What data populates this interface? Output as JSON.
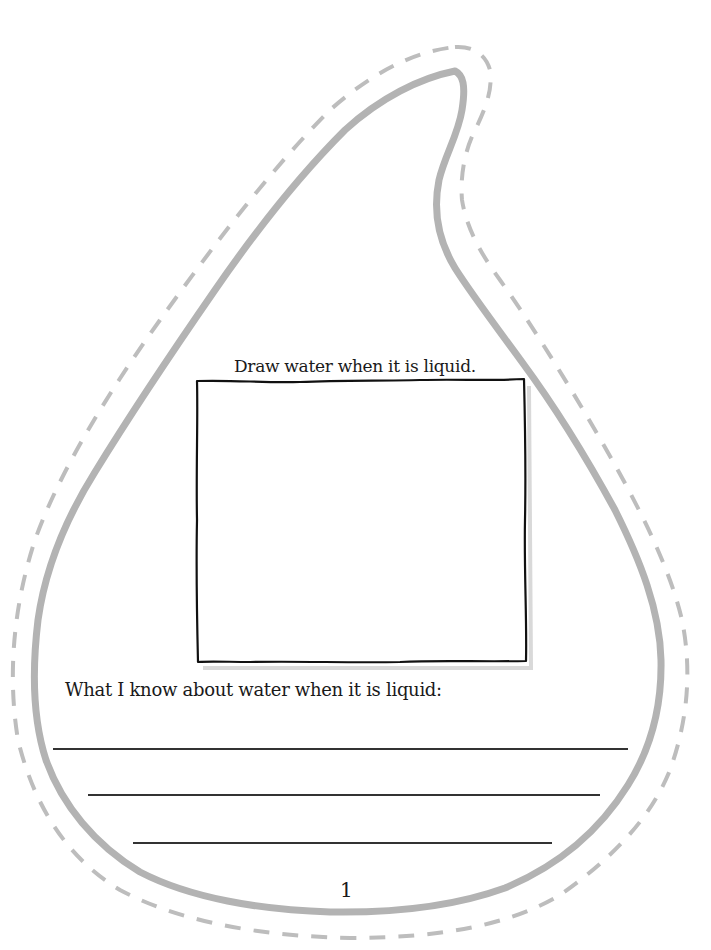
{
  "worksheet": {
    "shape": "water-drop",
    "draw_prompt": "Draw water when it is liquid.",
    "write_prompt": "What I know about water when it is liquid:",
    "writing_lines": [
      {
        "x1": 53,
        "x2": 628,
        "y": 749
      },
      {
        "x1": 88,
        "x2": 600,
        "y": 795
      },
      {
        "x1": 133,
        "x2": 552,
        "y": 843
      }
    ],
    "page_number": "1"
  },
  "colors": {
    "outline": "#b3b3b3",
    "cut_line": "#bdbdbd",
    "ink": "#1a1a1a",
    "background": "#ffffff"
  }
}
